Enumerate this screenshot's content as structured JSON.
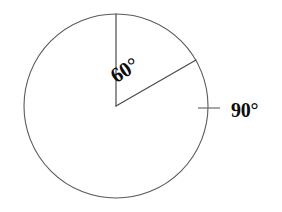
{
  "figure": {
    "type": "geometry-diagram",
    "background_color": "#ffffff",
    "line_color": "#5a5a5a",
    "text_color": "#0d0d0d",
    "circle": {
      "center_x": 116,
      "center_y": 106,
      "radius": 92
    },
    "radii": [
      {
        "name": "vertical-radius",
        "angle_deg_from_east": 90,
        "end_x": 116,
        "end_y": 14
      },
      {
        "name": "slanted-radius",
        "angle_deg_from_east": 30,
        "end_x": 196,
        "end_y": 60
      }
    ],
    "tick_mark": {
      "name": "right-tick",
      "x1": 198,
      "y1": 108,
      "x2": 220,
      "y2": 108
    },
    "labels": {
      "inner_angle": {
        "text": "60°",
        "x": 128,
        "y": 76,
        "rotation_deg": -32
      },
      "outer_angle": {
        "text": "90°",
        "x": 231,
        "y": 117,
        "rotation_deg": 0
      }
    }
  }
}
